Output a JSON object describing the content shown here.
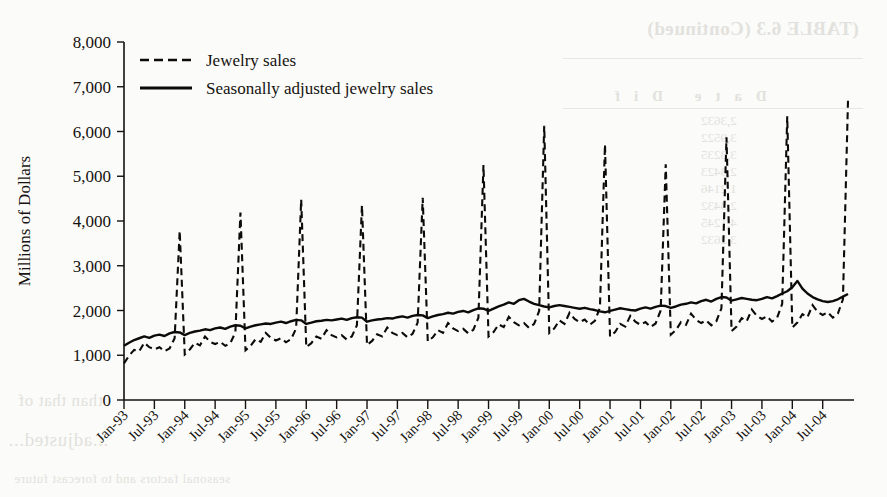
{
  "figure": {
    "background_color": "#fbfbf9",
    "ink_color": "#15120f"
  },
  "bleed_through": {
    "note": "faint mirrored show-through from reverse page",
    "title": "(TABLE 6.3   (Continued)",
    "header": "Date              Dif",
    "rows": [
      "2,3632",
      "3,9522",
      "3,3235",
      "2,3423",
      "1,2146",
      "2,3432",
      "4,1245",
      "3,2632"
    ],
    "lower_1": "than that of",
    "lower_2": "...adjusted...",
    "lower_3": "seasonal factors and to forecast future"
  },
  "legend": {
    "position": "top-left inside axes",
    "items": [
      {
        "label": "Jewelry sales",
        "style": "dashed"
      },
      {
        "label": "Seasonally adjusted jewelry sales",
        "style": "solid"
      }
    ]
  },
  "chart_data": {
    "type": "line",
    "title": "",
    "xlabel": "",
    "ylabel": "Millions of Dollars",
    "ylim": [
      0,
      8000
    ],
    "yticks": [
      0,
      1000,
      2000,
      3000,
      4000,
      5000,
      6000,
      7000,
      8000
    ],
    "ytick_labels": [
      "0",
      "1,000",
      "2,000",
      "3,000",
      "4,000",
      "5,000",
      "6,000",
      "7,000",
      "8,000"
    ],
    "grid": false,
    "legend_position": "upper left",
    "xtick_labels": [
      "Jan-93",
      "Jul-93",
      "Jan-94",
      "Jul-94",
      "Jan-95",
      "Jul-95",
      "Jan-96",
      "Jul-96",
      "Jan-97",
      "Jul-97",
      "Jan-98",
      "Jul-98",
      "Jan-99",
      "Jul-99",
      "Jan-00",
      "Jul-00",
      "Jan-01",
      "Jul-01",
      "Jan-02",
      "Jul-02",
      "Jan-03",
      "Jul-03",
      "Jan-04",
      "Jul-04"
    ],
    "xtick_rotation": 45,
    "x_start_month": "Jan-93",
    "x_end_month": "Dec-04",
    "n_points": 144,
    "series": [
      {
        "name": "Jewelry sales",
        "style": "dashed",
        "values": [
          820,
          990,
          1120,
          1090,
          1280,
          1180,
          1130,
          1180,
          1090,
          1150,
          1380,
          3780,
          1020,
          1130,
          1280,
          1220,
          1420,
          1300,
          1250,
          1300,
          1210,
          1270,
          1510,
          4190,
          1110,
          1210,
          1360,
          1300,
          1500,
          1390,
          1330,
          1380,
          1290,
          1360,
          1600,
          4480,
          1180,
          1270,
          1420,
          1370,
          1560,
          1450,
          1400,
          1450,
          1350,
          1420,
          1670,
          4350,
          1230,
          1320,
          1470,
          1420,
          1620,
          1500,
          1450,
          1500,
          1400,
          1480,
          1730,
          4520,
          1310,
          1400,
          1560,
          1500,
          1720,
          1600,
          1540,
          1590,
          1490,
          1570,
          1840,
          5250,
          1420,
          1520,
          1690,
          1630,
          1860,
          1740,
          1670,
          1720,
          1610,
          1700,
          1990,
          6130,
          1500,
          1600,
          1780,
          1700,
          1950,
          1810,
          1740,
          1800,
          1680,
          1770,
          2060,
          5710,
          1420,
          1520,
          1700,
          1640,
          1880,
          1750,
          1680,
          1740,
          1630,
          1710,
          2000,
          5270,
          1460,
          1560,
          1740,
          1680,
          1930,
          1790,
          1720,
          1780,
          1670,
          1760,
          2050,
          5870,
          1540,
          1640,
          1830,
          1760,
          2020,
          1880,
          1810,
          1870,
          1750,
          1840,
          2150,
          6340,
          1620,
          1730,
          1920,
          1850,
          2120,
          1970,
          1900,
          1960,
          1840,
          1930,
          2250,
          6690
        ]
      },
      {
        "name": "Seasonally adjusted jewelry sales",
        "style": "solid",
        "values": [
          1210,
          1280,
          1340,
          1380,
          1420,
          1390,
          1440,
          1460,
          1430,
          1490,
          1520,
          1510,
          1450,
          1500,
          1530,
          1550,
          1580,
          1560,
          1600,
          1620,
          1590,
          1640,
          1670,
          1660,
          1600,
          1640,
          1670,
          1690,
          1710,
          1700,
          1730,
          1750,
          1720,
          1760,
          1790,
          1780,
          1700,
          1730,
          1760,
          1770,
          1790,
          1780,
          1800,
          1820,
          1790,
          1830,
          1850,
          1840,
          1750,
          1780,
          1800,
          1810,
          1830,
          1820,
          1850,
          1870,
          1840,
          1880,
          1900,
          1890,
          1830,
          1870,
          1900,
          1920,
          1950,
          1930,
          1970,
          1990,
          1960,
          2010,
          2050,
          2040,
          1990,
          2040,
          2090,
          2130,
          2180,
          2150,
          2230,
          2260,
          2200,
          2150,
          2120,
          2090,
          2070,
          2100,
          2120,
          2100,
          2080,
          2060,
          2040,
          2060,
          2030,
          2010,
          1980,
          1960,
          1990,
          2020,
          2050,
          2030,
          2010,
          2000,
          2040,
          2070,
          2040,
          2080,
          2110,
          2100,
          2060,
          2090,
          2130,
          2150,
          2180,
          2160,
          2210,
          2240,
          2200,
          2260,
          2300,
          2290,
          2220,
          2250,
          2280,
          2260,
          2240,
          2230,
          2260,
          2300,
          2270,
          2320,
          2380,
          2430,
          2520,
          2660,
          2490,
          2380,
          2300,
          2250,
          2210,
          2190,
          2210,
          2250,
          2310,
          2370
        ]
      }
    ]
  }
}
